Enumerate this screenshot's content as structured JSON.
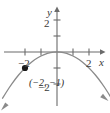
{
  "chart_data": {
    "type": "line",
    "title": "",
    "subtitle": "",
    "xlabel": "x",
    "ylabel": "y",
    "xlim": [
      -3.55,
      3.3
    ],
    "ylim": [
      -2.9,
      3.0
    ],
    "grid": false,
    "legend": null,
    "xticks": [
      -2,
      -1,
      1,
      2
    ],
    "yticks": [
      -2,
      1,
      2
    ],
    "xtick_labels": [
      "-2",
      "",
      "",
      "2"
    ],
    "ytick_labels": [
      "-2",
      "",
      "2"
    ],
    "equation": "y = -x^2/4",
    "series": [
      {
        "name": "parabola",
        "type": "line",
        "color": "#8a8a8a",
        "arrow_start": true,
        "arrow_end": true,
        "x": [
          -3.4,
          -3.2,
          -3.0,
          -2.8,
          -2.6,
          -2.4,
          -2.2,
          -2.0,
          -1.8,
          -1.6,
          -1.4,
          -1.2,
          -1.0,
          -0.8,
          -0.6,
          -0.4,
          -0.2,
          0.0,
          0.2,
          0.4,
          0.6,
          0.8,
          1.0,
          1.2,
          1.4,
          1.6,
          1.8,
          2.0,
          2.2,
          2.4,
          2.6,
          2.8,
          3.0,
          3.2,
          3.4
        ],
        "y": [
          -2.89,
          -2.56,
          -2.25,
          -1.96,
          -1.69,
          -1.44,
          -1.21,
          -1.0,
          -0.81,
          -0.64,
          -0.49,
          -0.36,
          -0.25,
          -0.16,
          -0.09,
          -0.04,
          -0.01,
          0.0,
          -0.01,
          -0.04,
          -0.09,
          -0.16,
          -0.25,
          -0.36,
          -0.49,
          -0.64,
          -0.81,
          -1.0,
          -1.21,
          -1.44,
          -1.69,
          -1.96,
          -2.25,
          -2.56,
          -2.89
        ]
      }
    ],
    "annotations": [
      {
        "name": "marked-point",
        "label": "(−2, −1)",
        "x": -2,
        "y": -1,
        "marker": "filled-circle",
        "marker_color": "#1a1a1a"
      }
    ]
  },
  "axes": {
    "x_axis_label": "x",
    "y_axis_label": "y",
    "x_tick_neg2": "−2",
    "x_tick_pos2": "2",
    "y_tick_pos2": "2",
    "y_tick_neg2": "−2"
  },
  "point_label": "(−2, −1)",
  "colors": {
    "axis": "#6b6b6b",
    "curve": "#8a8a8a",
    "point": "#1a1a1a",
    "text": "#3a3a3a",
    "background": "#ffffff"
  }
}
